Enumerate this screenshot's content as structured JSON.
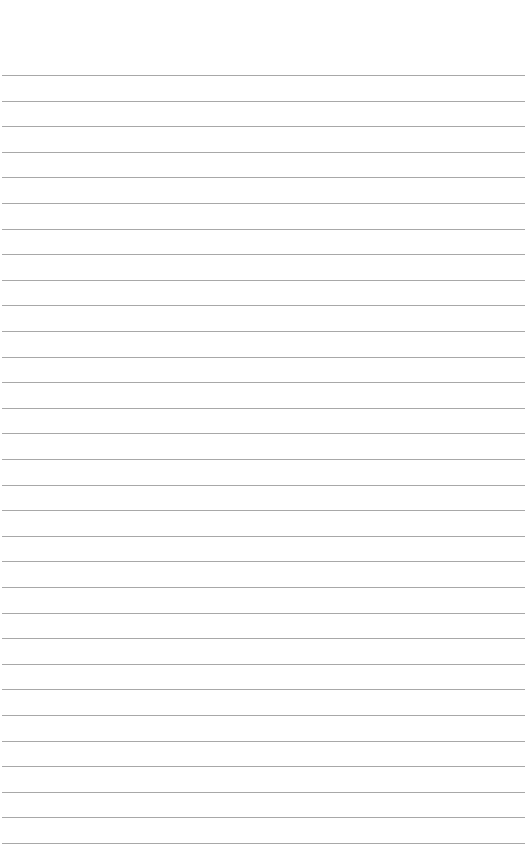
{
  "page": {
    "type": "blank-lined-paper",
    "line_color": "#a8a8a8",
    "background": "#ffffff",
    "first_line_y": 75,
    "line_spacing": 25.6,
    "line_count": 31
  }
}
